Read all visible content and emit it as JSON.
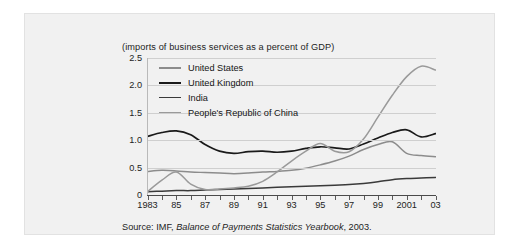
{
  "figure": {
    "subtitle": "(imports of business services as a percent of GDP)",
    "source_prefix": "Source: IMF,",
    "source_italic": "Balance of Payments Statistics Yearbook",
    "source_suffix": ", 2003."
  },
  "colors": {
    "united_states": "#8c8c8c",
    "united_kingdom": "#1a1a1a",
    "india": "#3a3a3a",
    "china": "#9a9a9a",
    "grid": "#cfcfcf",
    "panel": "#f1f1f1",
    "text": "#1d1d1d"
  },
  "legend": {
    "items": [
      {
        "label": "United States",
        "color": "#8c8c8c",
        "width": 2.6
      },
      {
        "label": "United  Kingdom",
        "color": "#1a1a1a",
        "width": 2.6
      },
      {
        "label": "India",
        "color": "#3a3a3a",
        "width": 1.3
      },
      {
        "label": "People's Republic of China",
        "color": "#9a9a9a",
        "width": 1.3
      }
    ]
  },
  "chart_data": {
    "type": "line",
    "title": "",
    "subtitle": "(imports of business services as a percent of GDP)",
    "xlabel": "",
    "ylabel": "",
    "grid": true,
    "legend_position": "inside-top-left",
    "xlim": [
      1983,
      2003
    ],
    "ylim": [
      0,
      2.5
    ],
    "yticks": [
      0,
      0.5,
      1.0,
      1.5,
      2.0,
      2.5
    ],
    "ytick_labels": [
      "0",
      "0.5",
      "1.0",
      "1.5",
      "2.0",
      "2.5"
    ],
    "x": [
      1983,
      1984,
      1985,
      1986,
      1987,
      1988,
      1989,
      1990,
      1991,
      1992,
      1993,
      1994,
      1995,
      1996,
      1997,
      1998,
      1999,
      2000,
      2001,
      2002,
      2003
    ],
    "xtick_labels": [
      "1983",
      "",
      "85",
      "",
      "87",
      "",
      "89",
      "",
      "91",
      "",
      "93",
      "",
      "95",
      "",
      "97",
      "",
      "99",
      "",
      "2001",
      "",
      "03"
    ],
    "series": [
      {
        "name": "United States",
        "color": "#8c8c8c",
        "values": [
          0.43,
          0.45,
          0.44,
          0.42,
          0.41,
          0.4,
          0.39,
          0.4,
          0.42,
          0.43,
          0.45,
          0.49,
          0.55,
          0.62,
          0.71,
          0.83,
          0.92,
          0.97,
          0.76,
          0.72,
          0.7
        ]
      },
      {
        "name": "United  Kingdom",
        "color": "#1a1a1a",
        "values": [
          1.07,
          1.14,
          1.17,
          1.1,
          0.92,
          0.8,
          0.76,
          0.79,
          0.8,
          0.78,
          0.8,
          0.85,
          0.88,
          0.86,
          0.84,
          0.93,
          1.04,
          1.14,
          1.19,
          1.06,
          1.12
        ]
      },
      {
        "name": "India",
        "color": "#3a3a3a",
        "values": [
          0.06,
          0.07,
          0.08,
          0.08,
          0.09,
          0.1,
          0.11,
          0.12,
          0.13,
          0.14,
          0.15,
          0.16,
          0.17,
          0.18,
          0.19,
          0.21,
          0.24,
          0.28,
          0.3,
          0.31,
          0.32
        ]
      },
      {
        "name": "People's Republic of China",
        "color": "#9a9a9a",
        "values": [
          0.06,
          0.27,
          0.42,
          0.2,
          0.1,
          0.11,
          0.13,
          0.16,
          0.25,
          0.42,
          0.62,
          0.8,
          0.94,
          0.8,
          0.79,
          1.02,
          1.42,
          1.82,
          2.16,
          2.35,
          2.28
        ]
      }
    ]
  }
}
